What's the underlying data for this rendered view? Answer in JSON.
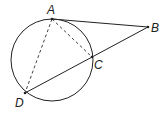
{
  "diagram": {
    "type": "geometry",
    "circle": {
      "cx": 52,
      "cy": 60,
      "r": 41
    },
    "points": {
      "A": {
        "label": "A",
        "x": 52,
        "y": 19
      },
      "B": {
        "label": "B",
        "x": 148,
        "y": 27
      },
      "C": {
        "label": "C",
        "x": 92,
        "y": 57
      },
      "D": {
        "label": "D",
        "x": 25,
        "y": 93
      }
    },
    "segments": [
      {
        "from": "A",
        "to": "B",
        "style": "solid"
      },
      {
        "from": "B",
        "to": "D",
        "style": "solid"
      },
      {
        "from": "A",
        "to": "C",
        "style": "dashed"
      },
      {
        "from": "A",
        "to": "D",
        "style": "dashed"
      }
    ],
    "stroke_color": "#222222"
  }
}
